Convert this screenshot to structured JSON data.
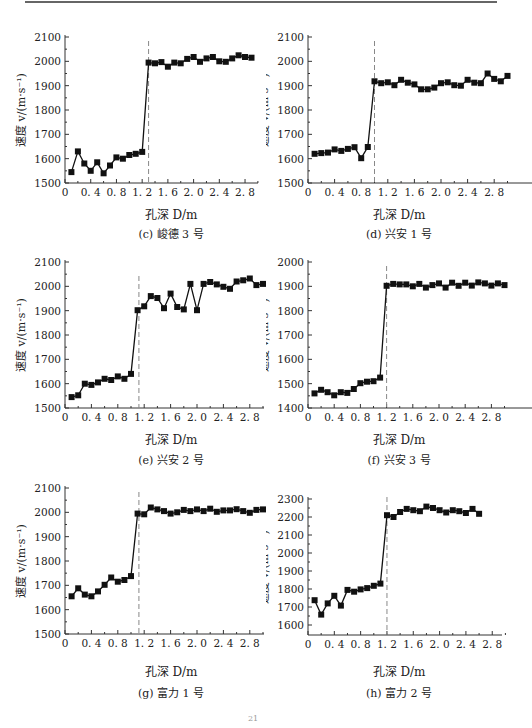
{
  "page": {
    "page_number": "21"
  },
  "chart_data": [
    {
      "id": "c",
      "type": "line",
      "caption": "(c) 峻德 3 号",
      "xlabel": "孔深 D/m",
      "ylabel": "速度 v/(m·s⁻¹)",
      "ylim": [
        1500,
        2100
      ],
      "yticks": [
        1500,
        1600,
        1700,
        1800,
        1900,
        2000,
        2100
      ],
      "xlim": [
        0,
        3.0
      ],
      "xticks": [
        "0",
        "0.4",
        "0.8",
        "1.2",
        "1.6",
        "2.0",
        "2.4",
        "2.8"
      ],
      "dashed_line_x": 1.3,
      "grid": false,
      "series": [
        {
          "name": "速度",
          "x": [
            0.1,
            0.2,
            0.3,
            0.4,
            0.5,
            0.6,
            0.7,
            0.8,
            0.9,
            1.0,
            1.1,
            1.2,
            1.3,
            1.4,
            1.5,
            1.6,
            1.7,
            1.8,
            1.9,
            2.0,
            2.1,
            2.2,
            2.3,
            2.4,
            2.5,
            2.6,
            2.7,
            2.8,
            2.9
          ],
          "values": [
            1545,
            1630,
            1580,
            1550,
            1585,
            1540,
            1572,
            1605,
            1600,
            1615,
            1620,
            1628,
            1995,
            1992,
            1997,
            1978,
            1995,
            1992,
            2010,
            2018,
            1998,
            2012,
            2018,
            2000,
            1998,
            2012,
            2025,
            2018,
            2015
          ]
        }
      ]
    },
    {
      "id": "d",
      "type": "line",
      "caption": "(d) 兴安 1 号",
      "xlabel": "孔深 D/m",
      "ylabel": "速度 v/(m·s⁻¹)",
      "ylim": [
        1500,
        2100
      ],
      "yticks": [
        1500,
        1600,
        1700,
        1800,
        1900,
        2000,
        2100
      ],
      "xlim": [
        0,
        3.0
      ],
      "xticks": [
        "0",
        "0.4",
        "0.8",
        "1.2",
        "1.6",
        "2.0",
        "2.4",
        "2.8"
      ],
      "dashed_line_x": 1.0,
      "grid": false,
      "series": [
        {
          "name": "速度",
          "x": [
            0.1,
            0.2,
            0.3,
            0.4,
            0.5,
            0.6,
            0.7,
            0.8,
            0.9,
            1.0,
            1.1,
            1.2,
            1.3,
            1.4,
            1.5,
            1.6,
            1.7,
            1.8,
            1.9,
            2.0,
            2.1,
            2.2,
            2.3,
            2.4,
            2.5,
            2.6,
            2.7,
            2.8,
            2.9,
            3.0
          ],
          "values": [
            1620,
            1623,
            1625,
            1638,
            1632,
            1640,
            1647,
            1602,
            1648,
            1918,
            1910,
            1914,
            1902,
            1924,
            1912,
            1905,
            1885,
            1885,
            1892,
            1910,
            1914,
            1902,
            1900,
            1924,
            1912,
            1910,
            1950,
            1928,
            1918,
            1940
          ]
        }
      ]
    },
    {
      "id": "e",
      "type": "line",
      "caption": "(e) 兴安 2 号",
      "xlabel": "孔深 D/m",
      "ylabel": "速度 v/(m·s⁻¹)",
      "ylim": [
        1500,
        2100
      ],
      "yticks": [
        1500,
        1600,
        1700,
        1800,
        1900,
        2000,
        2100
      ],
      "xlim": [
        0,
        3.0
      ],
      "xticks": [
        "0",
        "0.4",
        "0.8",
        "1.2",
        "1.6",
        "2.0",
        "2.4",
        "2.8"
      ],
      "dashed_line_x": 1.12,
      "grid": false,
      "series": [
        {
          "name": "速度",
          "x": [
            0.1,
            0.2,
            0.3,
            0.4,
            0.5,
            0.6,
            0.7,
            0.8,
            0.9,
            1.0,
            1.1,
            1.2,
            1.3,
            1.4,
            1.5,
            1.6,
            1.7,
            1.8,
            1.9,
            2.0,
            2.1,
            2.2,
            2.3,
            2.4,
            2.5,
            2.6,
            2.7,
            2.8,
            2.9,
            3.0
          ],
          "values": [
            1545,
            1552,
            1600,
            1595,
            1605,
            1620,
            1615,
            1630,
            1620,
            1640,
            1902,
            1918,
            1960,
            1952,
            1910,
            1970,
            1915,
            1905,
            2010,
            1902,
            2010,
            2018,
            2008,
            1998,
            1990,
            2020,
            2025,
            2032,
            2005,
            2010
          ]
        }
      ]
    },
    {
      "id": "f",
      "type": "line",
      "caption": "(f) 兴安 3 号",
      "xlabel": "孔深 D/m",
      "ylabel": "速度 v/(m·s⁻¹)",
      "ylim": [
        1400,
        2000
      ],
      "yticks": [
        1400,
        1500,
        1600,
        1700,
        1800,
        1900,
        2000
      ],
      "xlim": [
        0,
        3.0
      ],
      "xticks": [
        "0",
        "0.4",
        "0.8",
        "1.2",
        "1.6",
        "2.0",
        "2.4",
        "2.8"
      ],
      "dashed_line_x": 1.2,
      "grid": false,
      "series": [
        {
          "name": "速度",
          "x": [
            0.1,
            0.2,
            0.3,
            0.4,
            0.5,
            0.6,
            0.7,
            0.8,
            0.9,
            1.0,
            1.1,
            1.2,
            1.3,
            1.4,
            1.5,
            1.6,
            1.7,
            1.8,
            1.9,
            2.0,
            2.1,
            2.2,
            2.3,
            2.4,
            2.5,
            2.6,
            2.7,
            2.8,
            2.9,
            3.0
          ],
          "values": [
            1460,
            1475,
            1465,
            1452,
            1465,
            1462,
            1478,
            1502,
            1508,
            1510,
            1525,
            1902,
            1910,
            1908,
            1908,
            1900,
            1910,
            1895,
            1905,
            1912,
            1895,
            1915,
            1902,
            1915,
            1903,
            1916,
            1912,
            1903,
            1912,
            1905
          ]
        }
      ]
    },
    {
      "id": "g",
      "type": "line",
      "caption": "(g) 富力 1 号",
      "xlabel": "孔深 D/m",
      "ylabel": "速度 v/(m·s⁻¹)",
      "ylim": [
        1500,
        2100
      ],
      "yticks": [
        1500,
        1600,
        1700,
        1800,
        1900,
        2000,
        2100
      ],
      "xlim": [
        0,
        3.0
      ],
      "xticks": [
        "0",
        "0.4",
        "0.8",
        "1.2",
        "1.6",
        "2.0",
        "2.4",
        "2.8"
      ],
      "dashed_line_x": 1.12,
      "grid": false,
      "series": [
        {
          "name": "速度",
          "x": [
            0.1,
            0.2,
            0.3,
            0.4,
            0.5,
            0.6,
            0.7,
            0.8,
            0.9,
            1.0,
            1.1,
            1.2,
            1.3,
            1.4,
            1.5,
            1.6,
            1.7,
            1.8,
            1.9,
            2.0,
            2.1,
            2.2,
            2.3,
            2.4,
            2.5,
            2.6,
            2.7,
            2.8,
            2.9,
            3.0
          ],
          "values": [
            1655,
            1688,
            1662,
            1655,
            1675,
            1702,
            1732,
            1715,
            1722,
            1738,
            1995,
            1992,
            2020,
            2012,
            2005,
            1995,
            2000,
            2010,
            2005,
            2012,
            2005,
            2015,
            2002,
            2008,
            2008,
            2013,
            2005,
            1998,
            2010,
            2012
          ]
        }
      ]
    },
    {
      "id": "h",
      "type": "line",
      "caption": "(h) 富力 2 号",
      "xlabel": "孔深 D/m",
      "ylabel": "速度 v/(m·s⁻¹)",
      "ylim": [
        1550,
        2350
      ],
      "yticks": [
        1600,
        1700,
        1800,
        1900,
        2000,
        2100,
        2200,
        2300
      ],
      "xlim": [
        0,
        3.0
      ],
      "xticks": [
        "0",
        "0.4",
        "0.8",
        "1.2",
        "1.6",
        "2.0",
        "2.4",
        "2.8"
      ],
      "dashed_line_x": 1.2,
      "grid": false,
      "series": [
        {
          "name": "速度",
          "x": [
            0.1,
            0.2,
            0.3,
            0.4,
            0.5,
            0.6,
            0.7,
            0.8,
            0.9,
            1.0,
            1.1,
            1.2,
            1.3,
            1.4,
            1.5,
            1.6,
            1.7,
            1.8,
            1.9,
            2.0,
            2.1,
            2.2,
            2.3,
            2.4,
            2.5,
            2.6
          ],
          "values": [
            1738,
            1658,
            1720,
            1762,
            1708,
            1795,
            1785,
            1798,
            1805,
            1818,
            1830,
            2210,
            2200,
            2228,
            2245,
            2238,
            2232,
            2258,
            2250,
            2238,
            2225,
            2238,
            2232,
            2222,
            2245,
            2218
          ]
        }
      ]
    }
  ]
}
